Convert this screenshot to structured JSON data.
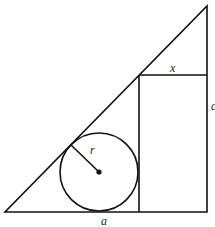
{
  "diagram": {
    "type": "geometry",
    "labels": {
      "radius": "r",
      "rect_width": "x",
      "base": "a",
      "right_side": "c"
    },
    "shapes": {
      "triangle": {
        "points": [
          [
            5,
            212
          ],
          [
            207,
            212
          ],
          [
            207,
            6
          ]
        ]
      },
      "rectangle": {
        "x1": 139,
        "y1": 75,
        "x2": 207,
        "y2": 212
      },
      "circle": {
        "cx": 99,
        "cy": 172,
        "r": 39
      },
      "radius_segment": {
        "from": [
          99,
          172
        ],
        "to": [
          71,
          145
        ]
      }
    },
    "colors": {
      "stroke": "#111111",
      "background": "#ffffff"
    }
  }
}
